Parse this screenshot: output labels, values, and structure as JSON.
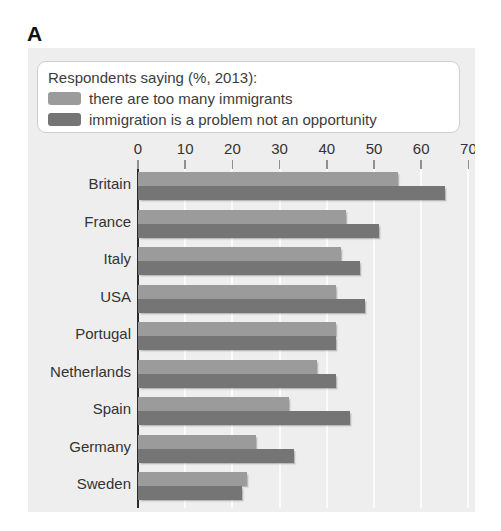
{
  "panel": {
    "letter": "A",
    "background_color": "#eeeeee"
  },
  "legend": {
    "title": "Respondents saying (%, 2013):",
    "items": [
      {
        "label": "there are too many immigrants",
        "color": "#9b9b9b",
        "swatch_name": "legend-swatch-too-many-immigrants"
      },
      {
        "label": "immigration is a problem not an opportunity",
        "color": "#757575",
        "swatch_name": "legend-swatch-immigration-problem"
      }
    ]
  },
  "chart_data": {
    "type": "bar",
    "orientation": "horizontal",
    "title": "",
    "subtitle": "",
    "xlabel": "",
    "ylabel": "",
    "xlim": [
      0,
      70
    ],
    "xticks": [
      0,
      10,
      20,
      30,
      40,
      50,
      60,
      70
    ],
    "xtick_labels": [
      "0",
      "10",
      "20",
      "30",
      "40",
      "50",
      "60",
      "70"
    ],
    "grid": true,
    "grid_axis": "x",
    "legend_position": "top",
    "categories": [
      "Britain",
      "France",
      "Italy",
      "USA",
      "Portugal",
      "Netherlands",
      "Spain",
      "Germany",
      "Sweden"
    ],
    "series": [
      {
        "name": "there are too many immigrants",
        "color": "#9b9b9b",
        "values": [
          55,
          44,
          43,
          42,
          42,
          38,
          32,
          25,
          23
        ]
      },
      {
        "name": "immigration is a problem not an opportunity",
        "color": "#757575",
        "values": [
          65,
          51,
          47,
          48,
          42,
          42,
          45,
          33,
          22
        ]
      }
    ]
  }
}
